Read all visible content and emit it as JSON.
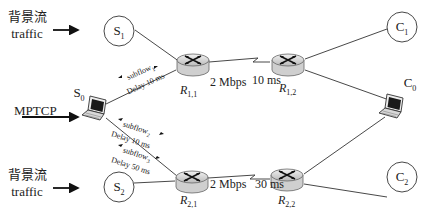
{
  "diagram": {
    "background_sources": [
      {
        "id": "S1",
        "zh": "背景流",
        "en": "traffic"
      },
      {
        "id": "S2",
        "zh": "背景流",
        "en": "traffic"
      }
    ],
    "mptcp_label": "MPTCP",
    "nodes": {
      "S0": {
        "base": "S",
        "sub": "0"
      },
      "S1": {
        "base": "S",
        "sub": "1"
      },
      "S2": {
        "base": "S",
        "sub": "2"
      },
      "C0": {
        "base": "C",
        "sub": "0"
      },
      "C1": {
        "base": "C",
        "sub": "1"
      },
      "C2": {
        "base": "C",
        "sub": "2"
      }
    },
    "routers": {
      "R11": {
        "base": "R",
        "sub": "1,1"
      },
      "R12": {
        "base": "R",
        "sub": "1,2"
      },
      "R21": {
        "base": "R",
        "sub": "2,1"
      },
      "R22": {
        "base": "R",
        "sub": "2,2"
      }
    },
    "links": {
      "top": {
        "bandwidth": "2 Mbps",
        "delay": "10 ms"
      },
      "bottom": {
        "bandwidth": "2 Mbps",
        "delay": "30 ms"
      }
    },
    "subflows": [
      {
        "name": "subflow",
        "sub": "1",
        "delay": "Delay 10 ms"
      },
      {
        "name": "subflow",
        "sub": "2",
        "delay": "Delay 10 ms"
      },
      {
        "name": "subflow",
        "sub": "3",
        "delay": "Delay 50 ms"
      }
    ]
  }
}
